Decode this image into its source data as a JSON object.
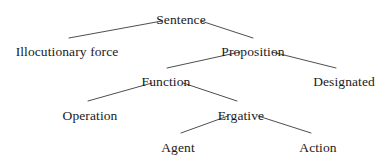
{
  "diagram": {
    "type": "tree",
    "width": 389,
    "height": 158,
    "background_color": "#ffffff",
    "text_color": "#1a1a1a",
    "edge_color": "#3a3a3a",
    "edge_width": 0.9,
    "nodes": [
      {
        "id": "sentence",
        "label": "Sentence",
        "cx": 181,
        "cy": 13,
        "level": 0
      },
      {
        "id": "illocutionary-force",
        "label": "Illocutionary force",
        "cx": 67,
        "cy": 45,
        "level": 1
      },
      {
        "id": "proposition",
        "label": "Proposition",
        "cx": 253,
        "cy": 45,
        "level": 1
      },
      {
        "id": "function",
        "label": "Function",
        "cx": 166,
        "cy": 75,
        "level": 2
      },
      {
        "id": "designated",
        "label": "Designated",
        "cx": 344,
        "cy": 75,
        "level": 2
      },
      {
        "id": "operation",
        "label": "Operation",
        "cx": 90,
        "cy": 109,
        "level": 3
      },
      {
        "id": "ergative",
        "label": "Ergative",
        "cx": 241,
        "cy": 109,
        "level": 3
      },
      {
        "id": "agent",
        "label": "Agent",
        "cx": 178,
        "cy": 141,
        "level": 4
      },
      {
        "id": "action",
        "label": "Action",
        "cx": 318,
        "cy": 141,
        "level": 4
      }
    ],
    "edges": [
      {
        "id": "sentence-illocutionary-force",
        "from": "sentence",
        "to": "illocutionary-force",
        "x1": 162,
        "y1": 21,
        "x2": 69,
        "y2": 38
      },
      {
        "id": "sentence-proposition",
        "from": "sentence",
        "to": "proposition",
        "x1": 201,
        "y1": 21,
        "x2": 253,
        "y2": 38
      },
      {
        "id": "proposition-function",
        "from": "proposition",
        "to": "function",
        "x1": 240,
        "y1": 52,
        "x2": 167,
        "y2": 68
      },
      {
        "id": "proposition-designated",
        "from": "proposition",
        "to": "designated",
        "x1": 272,
        "y1": 52,
        "x2": 336,
        "y2": 68
      },
      {
        "id": "function-operation",
        "from": "function",
        "to": "operation",
        "x1": 152,
        "y1": 83,
        "x2": 88,
        "y2": 101
      },
      {
        "id": "function-ergative",
        "from": "function",
        "to": "ergative",
        "x1": 183,
        "y1": 83,
        "x2": 237,
        "y2": 101
      },
      {
        "id": "ergative-agent",
        "from": "ergative",
        "to": "agent",
        "x1": 228,
        "y1": 116,
        "x2": 181,
        "y2": 133
      },
      {
        "id": "ergative-action",
        "from": "ergative",
        "to": "action",
        "x1": 258,
        "y1": 116,
        "x2": 311,
        "y2": 133
      }
    ]
  }
}
